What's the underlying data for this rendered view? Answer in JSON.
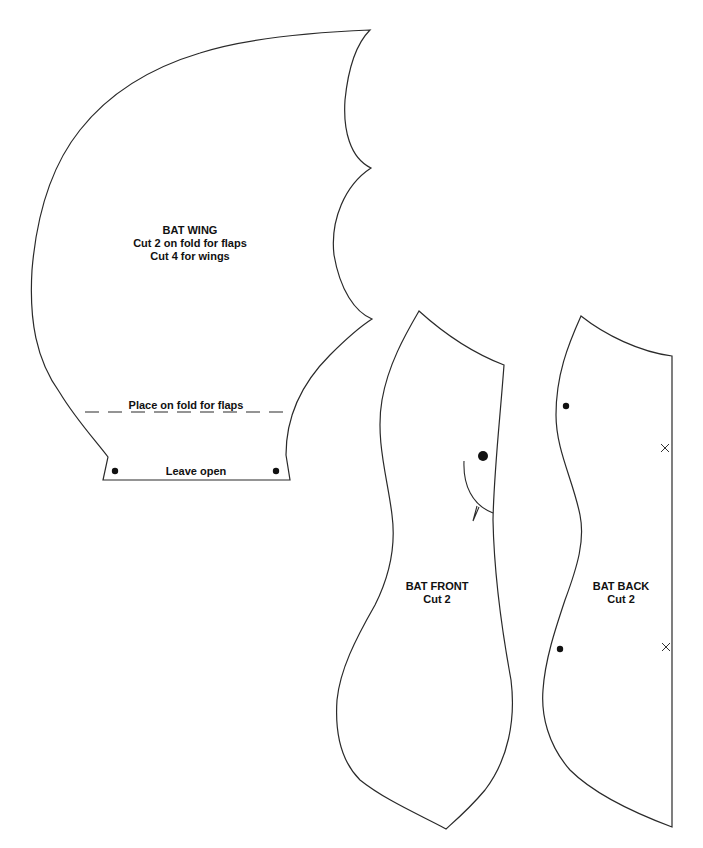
{
  "document": {
    "type": "sewing-pattern",
    "pieces": {
      "wing": {
        "title": "BAT WING",
        "instructions": [
          "Cut 2 on fold for flaps",
          "Cut 4 for wings"
        ],
        "fold_label": "Place on fold for flaps",
        "opening_label": "Leave open",
        "markers": [
          "dot",
          "dot"
        ]
      },
      "front": {
        "title": "BAT FRONT",
        "instructions": [
          "Cut 2"
        ],
        "markers": [
          "eye-dot",
          "mouth-curve",
          "fang"
        ]
      },
      "back": {
        "title": "BAT BACK",
        "instructions": [
          "Cut 2"
        ],
        "markers": [
          "dot",
          "dot",
          "cross",
          "cross"
        ]
      }
    }
  },
  "colors": {
    "paper": "#ffffff",
    "ink": "#2a2a2a"
  }
}
